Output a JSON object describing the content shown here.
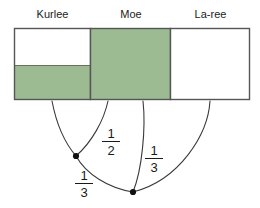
{
  "figure": {
    "background_color": "#ffffff",
    "shaded_color": "#9cbb92",
    "outline_color": "#555555",
    "curve_color": "#3a3a3a",
    "node_color": "#111111"
  },
  "labels": {
    "kurlee": "Kurlee",
    "moe": "Moe",
    "laree": "La-ree"
  },
  "bar_model": {
    "rect": {
      "x": 14,
      "y": 28,
      "width": 236,
      "height": 72
    },
    "sections": [
      {
        "name": "Kurlee",
        "x": 14,
        "width": 77,
        "shaded": true,
        "shaded_from_top": 38,
        "shaded_height": 34,
        "fill": "#9cbb92",
        "unshaded_fill": "#ffffff"
      },
      {
        "name": "Moe",
        "x": 91,
        "width": 80,
        "shaded": true,
        "shaded_from_top": 0,
        "shaded_height": 72,
        "fill": "#9cbb92",
        "unshaded_fill": "#ffffff"
      },
      {
        "name": "La-ree",
        "x": 171,
        "width": 79,
        "shaded": false,
        "shaded_from_top": 0,
        "shaded_height": 0,
        "fill": "#ffffff",
        "unshaded_fill": "#ffffff"
      }
    ]
  },
  "fractions": {
    "half": {
      "numerator": "1",
      "denominator": "2"
    },
    "third_left": {
      "numerator": "1",
      "denominator": "3"
    },
    "third_right": {
      "numerator": "1",
      "denominator": "3"
    }
  },
  "nodes": [
    {
      "id": "node-left",
      "x": 76,
      "y": 156
    },
    {
      "id": "node-right",
      "x": 133,
      "y": 192
    }
  ],
  "curves": [
    {
      "id": "curve-kurlee-to-node-left",
      "from_x": 52,
      "from_y": 101,
      "to_x": 76,
      "to_y": 156
    },
    {
      "id": "curve-moe-left-to-node-left",
      "from_x": 108,
      "from_y": 101,
      "to_x": 76,
      "to_y": 156
    },
    {
      "id": "curve-node-left-to-node-right",
      "from_x": 76,
      "from_y": 156,
      "to_x": 133,
      "to_y": 192
    },
    {
      "id": "curve-moe-right-to-node-right",
      "from_x": 143,
      "from_y": 101,
      "to_x": 133,
      "to_y": 192
    },
    {
      "id": "curve-laree-to-node-right",
      "from_x": 210,
      "from_y": 101,
      "to_x": 133,
      "to_y": 192
    }
  ]
}
